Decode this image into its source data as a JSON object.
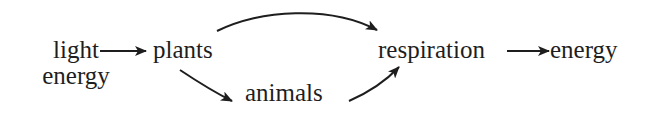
{
  "diagram": {
    "type": "flow",
    "nodes": {
      "light_energy": {
        "line1": "light",
        "line2": "energy"
      },
      "plants": {
        "label": "plants"
      },
      "animals": {
        "label": "animals"
      },
      "respiration": {
        "label": "respiration"
      },
      "energy": {
        "label": "energy"
      }
    },
    "edges": [
      {
        "from": "light energy",
        "to": "plants",
        "style": "straight"
      },
      {
        "from": "plants",
        "to": "respiration",
        "style": "curved-over"
      },
      {
        "from": "plants",
        "to": "animals",
        "style": "curved-down"
      },
      {
        "from": "animals",
        "to": "respiration",
        "style": "curved-up"
      },
      {
        "from": "respiration",
        "to": "energy",
        "style": "straight"
      }
    ],
    "colors": {
      "ink": "#1e1e1e",
      "background": "#ffffff"
    }
  }
}
